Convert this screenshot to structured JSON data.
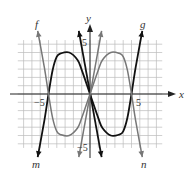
{
  "chart_data": {
    "type": "line",
    "title": "",
    "xlabel": "x",
    "ylabel": "y",
    "xlim": [
      -9,
      9
    ],
    "ylim": [
      -6.5,
      6.5
    ],
    "grid": true,
    "tick_labels": {
      "x_neg": "−5",
      "x_pos": "5",
      "y_pos": "5",
      "y_neg": "−5"
    },
    "series": [
      {
        "name": "m-g",
        "start_label": "m",
        "end_label": "g",
        "color": "#111111",
        "points": [
          [
            -6.3,
            -7.6
          ],
          [
            -5.5,
            -3.2
          ],
          [
            -5,
            0
          ],
          [
            -4.5,
            2.9
          ],
          [
            -4,
            4.5
          ],
          [
            -3.5,
            4.9
          ],
          [
            -2.5,
            5
          ],
          [
            -1.5,
            4.1
          ],
          [
            -1,
            2.9
          ],
          [
            0,
            0
          ],
          [
            1,
            -2.9
          ],
          [
            1.5,
            -4.1
          ],
          [
            2.5,
            -5
          ],
          [
            3.5,
            -4.9
          ],
          [
            4,
            -4.5
          ],
          [
            4.5,
            -2.9
          ],
          [
            5,
            0
          ],
          [
            5.5,
            3.2
          ],
          [
            6.3,
            7.6
          ]
        ]
      },
      {
        "name": "f-n",
        "start_label": "f",
        "end_label": "n",
        "color": "#777777",
        "points": [
          [
            -6.3,
            7.6
          ],
          [
            -5.5,
            3.2
          ],
          [
            -5,
            0
          ],
          [
            -4.5,
            -2.9
          ],
          [
            -4,
            -4.5
          ],
          [
            -3.5,
            -4.9
          ],
          [
            -2.5,
            -5
          ],
          [
            -1.5,
            -4.1
          ],
          [
            -1,
            -2.9
          ],
          [
            0,
            0
          ],
          [
            1,
            2.9
          ],
          [
            1.5,
            4.1
          ],
          [
            2.5,
            5
          ],
          [
            3.5,
            4.9
          ],
          [
            4,
            4.5
          ],
          [
            4.5,
            2.9
          ],
          [
            5,
            0
          ],
          [
            5.5,
            -3.2
          ],
          [
            6.3,
            -7.6
          ]
        ]
      },
      {
        "name": "steep-line-black",
        "color": "#111111",
        "points": [
          [
            -1.35,
            7.6
          ],
          [
            1.4,
            -7.6
          ]
        ]
      },
      {
        "name": "steep-line-gray",
        "color": "#777777",
        "points": [
          [
            -1.35,
            -7.6
          ],
          [
            1.4,
            7.6
          ]
        ]
      }
    ],
    "annotations": [
      "f",
      "g",
      "m",
      "n"
    ]
  }
}
